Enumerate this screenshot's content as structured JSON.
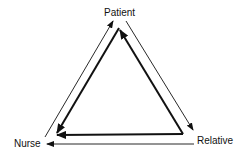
{
  "diagram": {
    "nodes": [
      {
        "id": "patient",
        "label": "Patient"
      },
      {
        "id": "nurse",
        "label": "Nurse"
      },
      {
        "id": "relative",
        "label": "Relative"
      }
    ],
    "edges": [
      {
        "from": "nurse",
        "to": "patient",
        "style": "thin",
        "position": "outer"
      },
      {
        "from": "patient",
        "to": "relative",
        "style": "thin",
        "position": "outer"
      },
      {
        "from": "relative",
        "to": "nurse",
        "style": "thin",
        "position": "outer"
      },
      {
        "from": "patient",
        "to": "nurse",
        "style": "thick",
        "position": "inner"
      },
      {
        "from": "relative",
        "to": "patient",
        "style": "thick",
        "position": "inner"
      },
      {
        "from": "relative",
        "to": "nurse",
        "style": "thick",
        "position": "inner"
      }
    ],
    "colors": {
      "line": "#111111",
      "background": "#ffffff"
    }
  }
}
